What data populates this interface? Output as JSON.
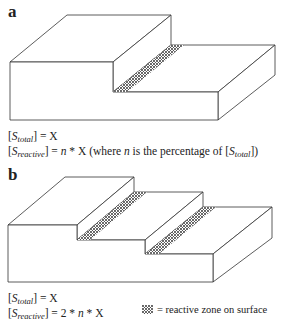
{
  "panel_a": {
    "label": "a",
    "eq1": {
      "var": "S",
      "sub": "total",
      "rhs": "] = X"
    },
    "eq2": {
      "var": "S",
      "sub": "reactive",
      "rhs_pre": "] = ",
      "n": "n",
      "rhs_mid": " * X (where ",
      "n2": "n",
      "rhs_post": " is the percentage of [",
      "var2": "S",
      "sub2": "total",
      "close": "])"
    }
  },
  "panel_b": {
    "label": "b",
    "eq1": {
      "var": "S",
      "sub": "total",
      "rhs": "] = X"
    },
    "eq2": {
      "var": "S",
      "sub": "reactive",
      "rhs_pre": "] = 2 * ",
      "n": "n",
      "rhs_post": " * X"
    }
  },
  "legend": {
    "icon": "dotted-pattern-swatch",
    "text": "= reactive zone on surface"
  },
  "colors": {
    "line": "#333333",
    "dots": "#222222",
    "background": "#ffffff"
  }
}
